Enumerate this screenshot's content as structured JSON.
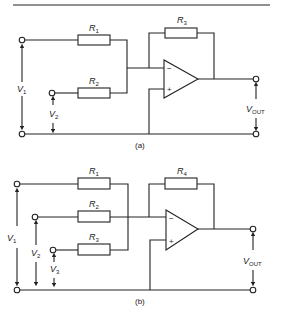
{
  "figure": {
    "diagram_a": {
      "caption": "(a)",
      "resistors": [
        {
          "name": "R",
          "sub": "1"
        },
        {
          "name": "R",
          "sub": "2"
        },
        {
          "name": "R",
          "sub": "3"
        }
      ],
      "voltages": [
        {
          "name": "V",
          "sub": "1"
        },
        {
          "name": "V",
          "sub": "2"
        },
        {
          "name": "V",
          "sub": "OUT"
        }
      ],
      "opamp": {
        "inverting": "−",
        "noninverting": "+"
      }
    },
    "diagram_b": {
      "caption": "(b)",
      "resistors": [
        {
          "name": "R",
          "sub": "1"
        },
        {
          "name": "R",
          "sub": "2"
        },
        {
          "name": "R",
          "sub": "3"
        },
        {
          "name": "R",
          "sub": "4"
        }
      ],
      "voltages": [
        {
          "name": "V",
          "sub": "1"
        },
        {
          "name": "V",
          "sub": "2"
        },
        {
          "name": "V",
          "sub": "3"
        },
        {
          "name": "V",
          "sub": "OUT"
        }
      ],
      "opamp": {
        "inverting": "−",
        "noninverting": "+"
      }
    }
  }
}
